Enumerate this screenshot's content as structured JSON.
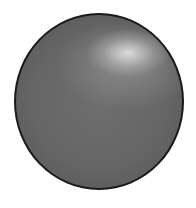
{
  "image": {
    "subject": "gray sphere",
    "colors": {
      "background": "#ffffff",
      "sphere_base": "#666666",
      "outline": "#1a1a1a",
      "highlight": "#e0e0e0"
    }
  }
}
